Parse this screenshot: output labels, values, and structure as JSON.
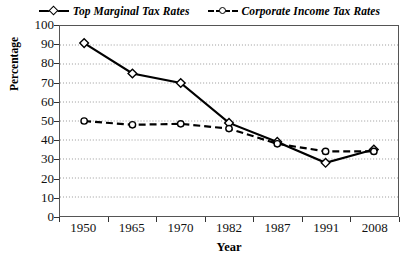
{
  "chart_data": {
    "type": "line",
    "title": "",
    "xlabel": "Year",
    "ylabel": "Percentage",
    "categories": [
      "1950",
      "1965",
      "1970",
      "1982",
      "1987",
      "1991",
      "2008"
    ],
    "ylim": [
      0,
      100
    ],
    "ytick_step": 10,
    "yticks": [
      "100",
      "90",
      "80",
      "70",
      "60",
      "50",
      "40",
      "30",
      "20",
      "10",
      "0"
    ],
    "grid": "horizontal-dotted",
    "legend_position": "top-center",
    "series": [
      {
        "name": "Top Marginal Tax Rates",
        "line_style": "solid",
        "marker": "diamond",
        "color": "#000000",
        "values": [
          91,
          75,
          70,
          49,
          39,
          28,
          35
        ]
      },
      {
        "name": "Corporate Income Tax Rates",
        "line_style": "dashed",
        "marker": "circle",
        "color": "#000000",
        "values": [
          50,
          48,
          48.5,
          46,
          38,
          34,
          34
        ]
      }
    ]
  }
}
